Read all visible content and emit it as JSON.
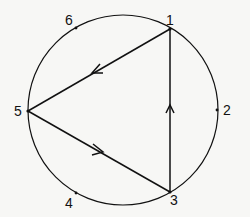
{
  "diagram": {
    "type": "circle-with-triangle",
    "circle": {
      "cx": 123,
      "cy": 110,
      "r": 95
    },
    "points": [
      {
        "id": "1",
        "label": "1",
        "x": 170,
        "y": 29,
        "lx": 166,
        "ly": 12
      },
      {
        "id": "2",
        "label": "2",
        "x": 217,
        "y": 110,
        "lx": 223,
        "ly": 103
      },
      {
        "id": "3",
        "label": "3",
        "x": 170,
        "y": 192,
        "lx": 170,
        "ly": 194
      },
      {
        "id": "4",
        "label": "4",
        "x": 76,
        "y": 193,
        "lx": 65,
        "ly": 198
      },
      {
        "id": "5",
        "label": "5",
        "x": 28,
        "y": 111,
        "lx": 14,
        "ly": 104
      },
      {
        "id": "6",
        "label": "6",
        "x": 76,
        "y": 28,
        "lx": 65,
        "ly": 13
      }
    ],
    "edges": [
      {
        "from": "1",
        "to": "5",
        "arrow": "toward 5"
      },
      {
        "from": "5",
        "to": "3",
        "arrow": "toward 3"
      },
      {
        "from": "3",
        "to": "1",
        "arrow": "toward 1"
      }
    ],
    "color": "#111111"
  }
}
